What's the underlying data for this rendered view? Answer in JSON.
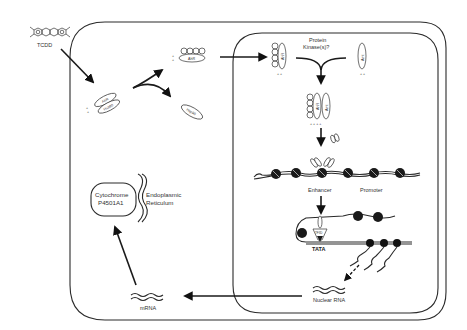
{
  "diagram": {
    "compartments": {
      "cell": "cytoplasm",
      "nucleus": "nucleus"
    },
    "labels": {
      "tcdd": "TCDD",
      "ahr": "AhR",
      "hsp90": "Hsp90",
      "arnt": "Arnt",
      "protein_kinase_line1": "Protein",
      "protein_kinase_line2": "Kinase(s)?",
      "enhancer": "Enhancer",
      "promoter": "Promoter",
      "tata": "TATA",
      "tfiid": "TFIID",
      "nuclear_rna": "Nuclear RNA",
      "mrna": "mRNA",
      "cyp_line1": "Cytochrome",
      "cyp_line2": "P4501A1",
      "er_line1": "Endoplasmic",
      "er_line2": "Reticulum",
      "charge": "+ +",
      "charge4": "+ + + +"
    },
    "steps": [
      "TCDD enters cell and binds AhR-Hsp90 complex",
      "Hsp90 dissociates from ligand-bound AhR",
      "AhR translocates into nucleus",
      "Protein kinase(s)? mediate AhR-Arnt heterodimerization",
      "AhR-Arnt binds enhancer upstream of promoter",
      "Transcription initiation at TATA box",
      "Nuclear RNA exported as mRNA",
      "mRNA translated to Cytochrome P4501A1 at Endoplasmic Reticulum"
    ]
  }
}
